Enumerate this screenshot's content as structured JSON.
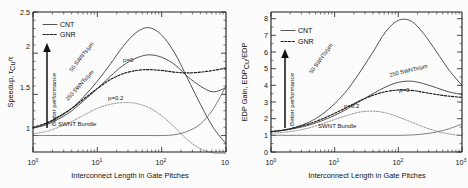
{
  "figure": {
    "panels": [
      {
        "id": "left",
        "xlabel": "Interconnect Length in Gate Pitches",
        "ylabel": "Speedup, τ",
        "ylabel_sub": "Cu",
        "ylabel_tail": "/τ",
        "xticks": [
          "10",
          "10",
          "10",
          "10"
        ],
        "xtick_exps": [
          "0",
          "1",
          "2",
          "3"
        ],
        "yticks": [
          "1",
          "1.5",
          "2",
          "2.5"
        ],
        "legend": [
          {
            "label": "CNT",
            "style": "solid"
          },
          {
            "label": "GNR",
            "style": "dotted"
          }
        ],
        "arrow_label": "Better performance",
        "annotations": [
          {
            "name": "cnt-50-label",
            "text": "50 SWNTs/µm"
          },
          {
            "name": "cnt-250-label",
            "text": "250 SWNTs/µm"
          },
          {
            "name": "gnr-p0-label",
            "text": "p=0"
          },
          {
            "name": "gnr-p02-label",
            "text": "p=0.2"
          },
          {
            "name": "swnt-bundle-label",
            "text": "SWNT Bundle"
          }
        ]
      },
      {
        "id": "right",
        "xlabel": "Interconnect Length in Gate Pitches",
        "ylabel": "EDP Gain, EDP",
        "ylabel_sub": "Cu",
        "ylabel_tail": "/EDP",
        "xticks": [
          "10",
          "10",
          "10",
          "10"
        ],
        "xtick_exps": [
          "0",
          "1",
          "2",
          "3"
        ],
        "yticks": [
          "0",
          "1",
          "2",
          "3",
          "4",
          "5",
          "6",
          "7",
          "8"
        ],
        "legend": [
          {
            "label": "CNT",
            "style": "solid"
          },
          {
            "label": "GNR",
            "style": "dotted"
          }
        ],
        "arrow_label": "Better performance",
        "annotations": [
          {
            "name": "cnt-50-label",
            "text": "50 SWNTs/µm"
          },
          {
            "name": "cnt-250-label",
            "text": "250 SWNTs/µm"
          },
          {
            "name": "gnr-p0-label",
            "text": "p=0"
          },
          {
            "name": "gnr-p02-label",
            "text": "p=0.2"
          },
          {
            "name": "swnt-bundle-label",
            "text": "SWNT Bundle"
          }
        ]
      }
    ]
  },
  "chart_data": [
    {
      "type": "line",
      "id": "speedup-vs-length",
      "title": "",
      "xlabel": "Interconnect Length in Gate Pitches",
      "ylabel": "Speedup, τ_Cu/τ",
      "xscale": "log",
      "xlim": [
        1,
        1000
      ],
      "ylim": [
        0.8,
        2.5
      ],
      "grid": false,
      "legend": [
        "CNT",
        "GNR"
      ],
      "legend_position": "top-left",
      "x": [
        1,
        1.6,
        2.5,
        4,
        6.3,
        10,
        16,
        25,
        40,
        63,
        100,
        160,
        250,
        400,
        630,
        1000
      ],
      "series": [
        {
          "name": "50 SWNTs/µm",
          "style": "CNT",
          "values": [
            1.09,
            1.14,
            1.22,
            1.33,
            1.48,
            1.66,
            1.87,
            2.08,
            2.25,
            2.31,
            2.22,
            2.0,
            1.7,
            1.38,
            1.1,
            0.9
          ]
        },
        {
          "name": "250 SWNTs/µm",
          "style": "CNT",
          "values": [
            1.09,
            1.13,
            1.2,
            1.3,
            1.43,
            1.57,
            1.72,
            1.85,
            1.94,
            1.98,
            1.95,
            1.86,
            1.72,
            1.6,
            1.53,
            1.58
          ]
        },
        {
          "name": "p=0",
          "style": "GNR",
          "values": [
            1.1,
            1.15,
            1.23,
            1.33,
            1.45,
            1.57,
            1.68,
            1.75,
            1.79,
            1.8,
            1.79,
            1.77,
            1.76,
            1.77,
            1.79,
            1.82
          ]
        },
        {
          "name": "p=0.2",
          "style": "GNR",
          "values": [
            1.02,
            1.05,
            1.1,
            1.17,
            1.25,
            1.33,
            1.38,
            1.4,
            1.39,
            1.34,
            1.24,
            1.1,
            0.95,
            0.84,
            0.79,
            0.78
          ]
        },
        {
          "name": "SWNT Bundle",
          "style": "CNT",
          "values": [
            1.0,
            1.0,
            1.0,
            1.0,
            1.0,
            1.0,
            1.0,
            1.0,
            1.0,
            1.0,
            1.0,
            1.01,
            1.05,
            1.14,
            1.32,
            1.6
          ]
        }
      ]
    },
    {
      "type": "line",
      "id": "edp-gain-vs-length",
      "title": "",
      "xlabel": "Interconnect Length in Gate Pitches",
      "ylabel": "EDP Gain, EDP_Cu/EDP",
      "xscale": "log",
      "xlim": [
        1,
        1000
      ],
      "ylim": [
        0,
        8.4
      ],
      "grid": false,
      "legend": [
        "CNT",
        "GNR"
      ],
      "legend_position": "top-left",
      "x": [
        1,
        1.6,
        2.5,
        4,
        6.3,
        10,
        16,
        25,
        40,
        63,
        100,
        160,
        250,
        400,
        630,
        1000
      ],
      "series": [
        {
          "name": "50 SWNTs/µm",
          "style": "CNT",
          "values": [
            1.22,
            1.32,
            1.5,
            1.8,
            2.25,
            2.9,
            3.75,
            4.8,
            6.0,
            7.2,
            7.9,
            7.85,
            7.1,
            6.0,
            4.9,
            4.0
          ]
        },
        {
          "name": "250 SWNTs/µm",
          "style": "CNT",
          "values": [
            1.22,
            1.3,
            1.43,
            1.62,
            1.88,
            2.2,
            2.6,
            3.05,
            3.5,
            3.9,
            4.18,
            4.25,
            4.1,
            3.85,
            3.6,
            3.45
          ]
        },
        {
          "name": "p=0",
          "style": "GNR",
          "values": [
            1.22,
            1.32,
            1.48,
            1.7,
            1.98,
            2.32,
            2.7,
            3.08,
            3.4,
            3.62,
            3.72,
            3.7,
            3.58,
            3.45,
            3.35,
            3.28
          ]
        },
        {
          "name": "p=0.2",
          "style": "GNR",
          "values": [
            1.12,
            1.18,
            1.28,
            1.45,
            1.68,
            1.95,
            2.2,
            2.4,
            2.45,
            2.35,
            2.1,
            1.8,
            1.5,
            1.25,
            1.08,
            0.98
          ]
        },
        {
          "name": "SWNT Bundle",
          "style": "CNT",
          "values": [
            1.0,
            1.0,
            1.0,
            1.0,
            1.0,
            1.0,
            1.0,
            1.0,
            1.0,
            1.0,
            1.0,
            1.02,
            1.08,
            1.2,
            1.4,
            1.68
          ]
        }
      ]
    }
  ]
}
